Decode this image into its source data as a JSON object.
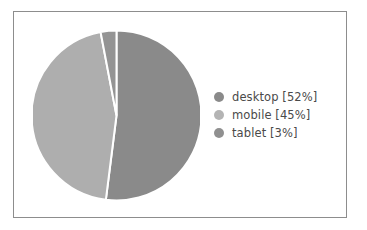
{
  "chart_data": {
    "type": "pie",
    "title": "",
    "categories": [
      "desktop",
      "mobile",
      "tablet"
    ],
    "values": [
      52,
      45,
      3
    ],
    "labels": [
      "desktop [52%]",
      "mobile [45%]",
      "tablet [3%]"
    ],
    "units": "%",
    "start_angle_deg": 0,
    "direction": "clockwise",
    "wedge_edge_color": "#ffffff",
    "wedge_edge_width": 1.5,
    "legend_position": "right",
    "grid": false,
    "colors": [
      "#8a8a8a",
      "#aeaeae",
      "#949494"
    ],
    "background": "#ffffff",
    "frame_color": "#8d8d8d"
  },
  "legend": {
    "items": [
      {
        "label": "desktop [52%]",
        "color": "#8a8a8a"
      },
      {
        "label": "mobile [45%]",
        "color": "#b4b4b4"
      },
      {
        "label": "tablet [3%]",
        "color": "#909090"
      }
    ]
  }
}
